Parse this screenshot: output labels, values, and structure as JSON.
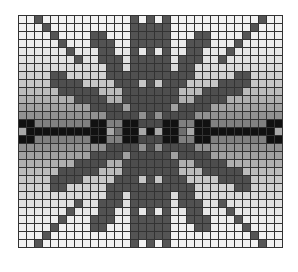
{
  "grid": {
    "cols": 33,
    "rows": 29,
    "palette": {
      "bg_top": "#f2f2f2",
      "bg_mid": "#6e6e6e",
      "motif": "#555555",
      "band": "#111111",
      "light": "#a8a8a8"
    }
  }
}
